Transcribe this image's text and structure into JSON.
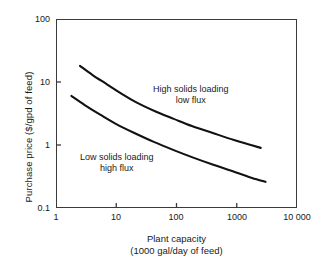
{
  "chart_data": {
    "type": "line",
    "title": "",
    "xlabel": "Plant capacity (1000 gal/day of feed)",
    "ylabel": "Purchase price ($/gpd of feed)",
    "xscale": "log",
    "yscale": "log",
    "xlim": [
      1,
      10000
    ],
    "ylim": [
      0.1,
      100
    ],
    "grid": false,
    "legend_position": "inline-annotations",
    "xticks": [
      1,
      10,
      100,
      1000,
      10000
    ],
    "xticklabels": [
      "1",
      "10",
      "100",
      "1000",
      "10 000"
    ],
    "yticks": [
      0.1,
      1,
      10,
      100
    ],
    "yticklabels": [
      "0.1",
      "1",
      "10",
      "100"
    ],
    "series": [
      {
        "name": "High solids loading, low flux",
        "x": [
          2.5,
          4,
          7,
          12,
          22,
          45,
          90,
          180,
          400,
          900,
          1600,
          2500
        ],
        "y": [
          18.0,
          13.0,
          9.2,
          6.6,
          4.7,
          3.4,
          2.6,
          2.0,
          1.55,
          1.2,
          1.02,
          0.9
        ]
      },
      {
        "name": "Low solids loading, high flux",
        "x": [
          1.8,
          3,
          5.5,
          10,
          20,
          42,
          90,
          190,
          420,
          950,
          1800,
          3000
        ],
        "y": [
          6.0,
          4.3,
          3.0,
          2.15,
          1.55,
          1.12,
          0.83,
          0.63,
          0.48,
          0.37,
          0.3,
          0.26
        ]
      }
    ],
    "annotations": [
      {
        "id": "high",
        "line1": "High solids loading",
        "line2": "low flux"
      },
      {
        "id": "low",
        "line1": "Low solids loading",
        "line2": "high flux"
      }
    ]
  },
  "axis": {
    "y_title": "Purchase price ($/gpd of feed)",
    "x_title_line1": "Plant capacity",
    "x_title_line2": "(1000 gal/day of feed)",
    "y_labels": {
      "t0": "100",
      "t1": "10",
      "t2": "1",
      "t3": "0.1"
    },
    "x_labels": {
      "t0": "1",
      "t1": "10",
      "t2": "100",
      "t3": "1000",
      "t4": "10 000"
    }
  },
  "annotations": {
    "high_line1": "High solids loading",
    "high_line2": "low flux",
    "low_line1": "Low solids loading",
    "low_line2": "high flux"
  },
  "colors": {
    "axis": "#3a3a3a",
    "curve": "#111111",
    "text": "#1a1a1a",
    "background": "#ffffff"
  }
}
